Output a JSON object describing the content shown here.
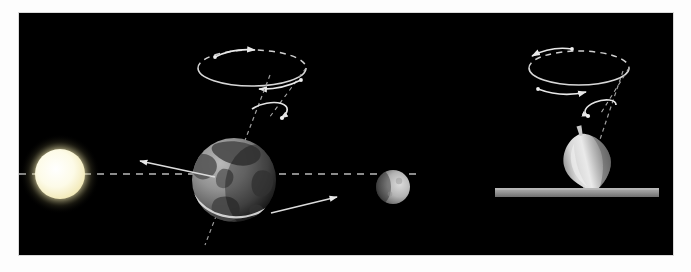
{
  "figure": {
    "background_color": "#ffffff",
    "canvas_color": "#000000",
    "canvas": {
      "x": 19,
      "y": 13,
      "width": 654,
      "height": 242
    }
  },
  "colors": {
    "space_black": "#000000",
    "sun_core": "#ffffff",
    "sun_glow": "#fff6c9",
    "earth_ocean": "#8c8c8c",
    "earth_land": "#4a4a4a",
    "earth_shadow": "#1a1a1a",
    "moon_lit": "#cfcfcf",
    "moon_dark": "#5a5a5a",
    "top_body": "#d8d8d8",
    "top_shade": "#8f8f8f",
    "table_surface": "#9a9a9a",
    "guide_line": "#c8c8c8",
    "arrow_stroke": "#e8e8e8",
    "axis_stroke": "#9e9e9e",
    "paper_border": "#fdfdfd"
  },
  "scene_left": {
    "label": "earth-precession-scene",
    "sun": {
      "name": "sun",
      "cx": 41,
      "cy": 161,
      "radius": 26,
      "glow_radius": 38,
      "description": "glowing white-yellow star"
    },
    "ecliptic": {
      "name": "ecliptic-dashed-line",
      "x1": 0,
      "x2": 400,
      "y": 161,
      "style": "dashed",
      "dash": "7 6"
    },
    "earth": {
      "name": "earth",
      "cx": 215,
      "cy": 167,
      "radius": 42,
      "axis_tilt_deg": 23,
      "equator_band": true,
      "description": "grayscale globe with continents and a bright equatorial ring"
    },
    "earth_axis": {
      "name": "earth-rotation-axis",
      "x1": 247,
      "y1": 66,
      "x2": 190,
      "y2": 215,
      "style": "dashed"
    },
    "precession_circle": {
      "name": "precession-cone-circle",
      "cx": 233,
      "cy": 55,
      "rx": 54,
      "ry": 18,
      "front_style": "solid",
      "back_style": "dashed",
      "arrow_top_direction": "right",
      "arrow_bottom_direction": "left"
    },
    "spin_loop": {
      "name": "earth-spin-arrow",
      "cx": 249,
      "cy": 99,
      "rx": 17,
      "ry": 7,
      "direction": "counterclockwise"
    },
    "orbit_arrow_left": {
      "name": "orbital-arrow-left",
      "x1": 194,
      "y1": 163,
      "x2": 124,
      "y2": 148,
      "points": "left"
    },
    "orbit_arrow_right": {
      "name": "orbital-arrow-right",
      "x1": 255,
      "y1": 199,
      "x2": 315,
      "y2": 184,
      "points": "right"
    },
    "moon": {
      "name": "moon",
      "cx": 374,
      "cy": 174,
      "radius": 17,
      "lit_side": "right"
    }
  },
  "scene_right": {
    "label": "spinning-top-scene",
    "top": {
      "name": "spinning-top",
      "cx": 568,
      "cy": 148,
      "width": 40,
      "height": 58,
      "tilt_deg": 14,
      "description": "pear-shaped gyroscope top with a thin stem touching the table"
    },
    "top_axis": {
      "name": "top-rotation-axis",
      "x1": 601,
      "y1": 64,
      "x2": 566,
      "y2": 182,
      "style": "dashed"
    },
    "precession_circle": {
      "name": "precession-cone-circle",
      "cx": 560,
      "cy": 55,
      "rx": 50,
      "ry": 17,
      "front_style": "solid",
      "back_style": "dashed",
      "arrow_top_direction": "left",
      "arrow_bottom_direction": "right"
    },
    "spin_loop": {
      "name": "top-spin-arrow",
      "cx": 580,
      "cy": 98,
      "rx": 16,
      "ry": 7,
      "direction": "clockwise"
    },
    "table": {
      "name": "table-surface",
      "x": 476,
      "y": 175,
      "width": 164,
      "height": 9,
      "color": "#9a9a9a"
    }
  }
}
